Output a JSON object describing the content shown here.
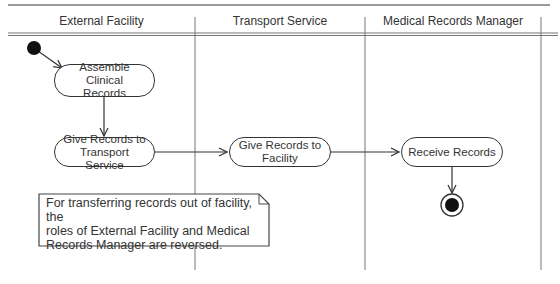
{
  "diagram": {
    "type": "UML activity diagram with swimlanes",
    "lanes": [
      {
        "id": "external",
        "label": "External Facility"
      },
      {
        "id": "transport",
        "label": "Transport Service"
      },
      {
        "id": "manager",
        "label": "Medical Records Manager"
      }
    ],
    "nodes": {
      "start": {
        "kind": "initial"
      },
      "assemble": {
        "kind": "action",
        "lane": "external",
        "label": "Assemble Clinical\nRecords"
      },
      "give_transport": {
        "kind": "action",
        "lane": "external",
        "label": "Give Records to\nTransport Service"
      },
      "give_facility": {
        "kind": "action",
        "lane": "transport",
        "label": "Give Records to\nFacility"
      },
      "receive": {
        "kind": "action",
        "lane": "manager",
        "label": "Receive Records"
      },
      "end": {
        "kind": "final"
      }
    },
    "edges": [
      {
        "from": "start",
        "to": "assemble"
      },
      {
        "from": "assemble",
        "to": "give_transport"
      },
      {
        "from": "give_transport",
        "to": "give_facility"
      },
      {
        "from": "give_facility",
        "to": "receive"
      },
      {
        "from": "receive",
        "to": "end"
      }
    ],
    "note": {
      "text": "For transferring records out of facility, the\nroles of External Facility and Medical\nRecords Manager are reversed."
    }
  }
}
